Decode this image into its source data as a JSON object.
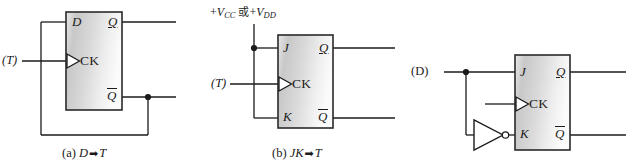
{
  "figure": {
    "line_color": "#1b1b1b",
    "box_border_color": "#2a2a2a",
    "box_fill_light": "#f2f2f2",
    "box_fill_dark": "#b9b9b9"
  },
  "circuit_a": {
    "caption_prefix": "(a)",
    "caption_from": "D",
    "caption_arrow": "➡",
    "caption_to": "T",
    "input_label": "(T)",
    "terminals": {
      "d": "D",
      "ck": "CK",
      "q": "Q",
      "qbar": "Q"
    }
  },
  "circuit_b": {
    "caption_prefix": "(b)",
    "caption_from": "JK",
    "caption_arrow": "➡",
    "caption_to": "T",
    "input_label": "(T)",
    "supply_plus1": "+",
    "supply_v1": "V",
    "supply_sub1": "CC",
    "supply_or": "或",
    "supply_plus2": "+",
    "supply_v2": "V",
    "supply_sub2": "DD",
    "terminals": {
      "j": "J",
      "ck": "CK",
      "k": "K",
      "q": "Q",
      "qbar": "Q"
    }
  },
  "circuit_c": {
    "input_label": "(D)",
    "terminals": {
      "j": "J",
      "ck": "CK",
      "k": "K",
      "q": "Q",
      "qbar": "Q"
    }
  }
}
